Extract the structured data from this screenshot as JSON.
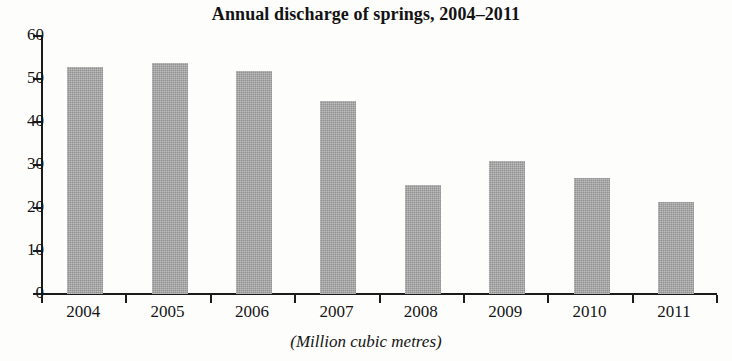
{
  "chart_data": {
    "type": "bar",
    "title": "Annual discharge of springs, 2004–2011",
    "caption": "(Million cubic metres)",
    "xlabel": "",
    "ylabel": "",
    "categories": [
      "2004",
      "2005",
      "2006",
      "2007",
      "2008",
      "2009",
      "2010",
      "2011"
    ],
    "values": [
      52.8,
      53.8,
      51.8,
      45.0,
      25.4,
      30.9,
      27.0,
      21.4
    ],
    "ylim": [
      0,
      60
    ],
    "ytick_labels": [
      "0",
      "10",
      "20",
      "30",
      "40",
      "50",
      "60"
    ],
    "ytick_values": [
      0,
      10,
      20,
      30,
      40,
      50,
      60
    ],
    "grid": false,
    "legend": null,
    "bar_color": "#a3a3a3",
    "axis_color": "#1b1b1b",
    "text_color": "#141414",
    "background_color": "#fdfdfc"
  }
}
